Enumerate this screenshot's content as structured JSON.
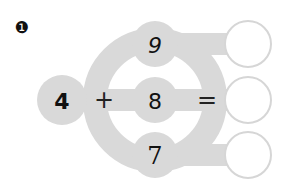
{
  "exercise": {
    "number_label": "❶",
    "left_operand": "4",
    "operator": "+",
    "equals": "=",
    "right_operands": [
      "9",
      "8",
      "7"
    ],
    "answers": [
      "",
      "",
      ""
    ]
  },
  "colors": {
    "shape_fill": "#d9d9d9",
    "answer_stroke": "#d6d6d6",
    "text": "#111111",
    "background": "#ffffff"
  }
}
